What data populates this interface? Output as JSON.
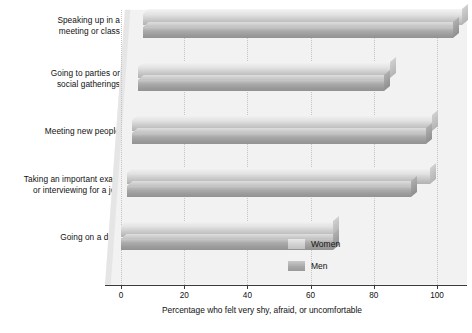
{
  "chart_data": {
    "type": "bar",
    "orientation": "horizontal",
    "style": "3d-grouped-horizontal-bar",
    "title": "",
    "xlabel": "Percentage who felt very shy, afraid, or uncomfortable",
    "ylabel": "",
    "xlim": [
      0,
      105
    ],
    "xticks": [
      0,
      20,
      40,
      60,
      80,
      100
    ],
    "xtick_labels": [
      "0",
      "20",
      "40",
      "60",
      "80",
      "100"
    ],
    "grid": "vertical-dotted",
    "legend_position": "bottom-right",
    "categories": [
      "Speaking up in a\nmeeting or class",
      "Going to parties or\nsocial gatherings",
      "Meeting new people",
      "Taking an important exam\nor interviewing for a job",
      "Going on a date"
    ],
    "series": [
      {
        "name": "Women",
        "color": "#cfcfcf",
        "values": [
          101,
          80,
          95,
          96,
          67
        ]
      },
      {
        "name": "Men",
        "color": "#a6a6a6",
        "values": [
          98,
          78,
          93,
          90,
          67
        ]
      }
    ]
  },
  "legend": {
    "items": [
      {
        "label": "Women",
        "swatch": "women"
      },
      {
        "label": "Men",
        "swatch": "men"
      }
    ]
  }
}
